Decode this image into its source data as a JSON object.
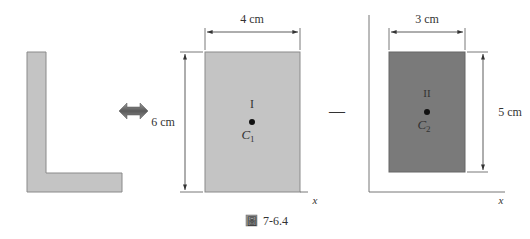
{
  "figure": {
    "caption_prefix": "圖",
    "caption_number": "7-6.4"
  },
  "composite_shape": {
    "name": "L-shape",
    "fill": "#c4c4c4",
    "stroke": "#8a8a8a"
  },
  "operator_equivalence": {
    "icon": "double-arrow-icon",
    "color": "#6b6b6b"
  },
  "rect_I": {
    "region_label": "I",
    "centroid_label": "C",
    "centroid_subscript": "1",
    "width_label": "4 cm",
    "height_label": "6 cm",
    "axis_label": "x",
    "fill": "#c4c4c4"
  },
  "operator_minus": {
    "symbol": "—"
  },
  "rect_II": {
    "region_label": "II",
    "centroid_label": "C",
    "centroid_subscript": "2",
    "width_label": "3 cm",
    "height_label": "5 cm",
    "axis_label": "x",
    "fill": "#7a7a7a"
  }
}
